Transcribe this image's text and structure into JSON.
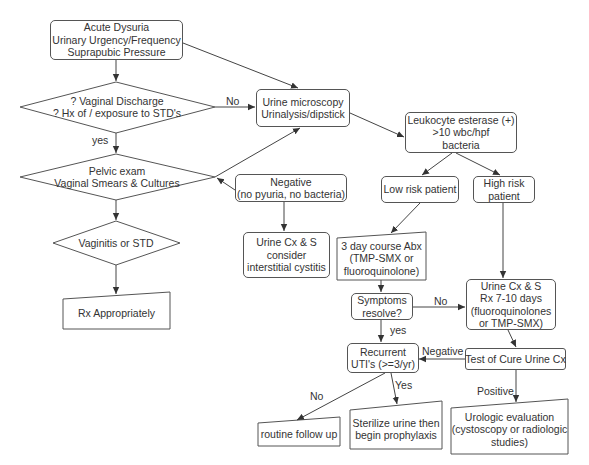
{
  "nodes": {
    "start": {
      "lines": [
        "Acute Dysuria",
        "Urinary Urgency/Frequency",
        "Suprapubic Pressure"
      ]
    },
    "std_question": {
      "lines": [
        "? Vaginal Discharge",
        "? Hx of / exposure to STD's"
      ]
    },
    "pelvic_exam": {
      "lines": [
        "Pelvic exam",
        "Vaginal Smears & Cultures"
      ]
    },
    "vaginitis": {
      "lines": [
        "Vaginitis or STD"
      ]
    },
    "rx_appropriately": {
      "lines": [
        "Rx Appropriately"
      ]
    },
    "urine_microscopy": {
      "lines": [
        "Urine microscopy",
        "Urinalysis/dipstick"
      ]
    },
    "negative": {
      "lines": [
        "Negative",
        "(no pyuria, no bacteria)"
      ]
    },
    "urine_cx_ic": {
      "lines": [
        "Urine Cx & S",
        "consider",
        "interstitial cystitis"
      ]
    },
    "leukocyte": {
      "lines": [
        "Leukocyte esterase (+)",
        ">10 wbc/hpf",
        "bacteria"
      ]
    },
    "low_risk": {
      "lines": [
        "Low risk patient"
      ]
    },
    "high_risk": {
      "lines": [
        "High risk",
        "patient"
      ]
    },
    "three_day": {
      "lines": [
        "3 day course Abx",
        "(TMP-SMX or",
        "fluoroquinolone)"
      ]
    },
    "symptoms_resolve": {
      "lines": [
        "Symptoms",
        "resolve?"
      ]
    },
    "urine_cx_rx": {
      "lines": [
        "Urine Cx & S",
        "Rx 7-10 days",
        "(fluoroquinolones",
        "or TMP-SMX)"
      ]
    },
    "recurrent": {
      "lines": [
        "Recurrent",
        "UTI's (>=3/yr)"
      ]
    },
    "test_of_cure": {
      "lines": [
        "Test of Cure Urine Cx"
      ]
    },
    "routine": {
      "lines": [
        "routine follow up"
      ]
    },
    "sterilize": {
      "lines": [
        "Sterilize urine then",
        "begin prophylaxis"
      ]
    },
    "urologic": {
      "lines": [
        "Urologic evaluation",
        "(cystoscopy or radiologic",
        "studies)"
      ]
    }
  },
  "edge_labels": {
    "no_std": "No",
    "yes_std": "yes",
    "no_symptoms": "No",
    "yes_symptoms": "yes",
    "negative_cure": "Negative",
    "positive_cure": "Positive",
    "no_recurrent": "No",
    "yes_recurrent": "Yes"
  },
  "colors": {
    "stroke": "#555555",
    "text": "#333333",
    "background": "#ffffff"
  }
}
